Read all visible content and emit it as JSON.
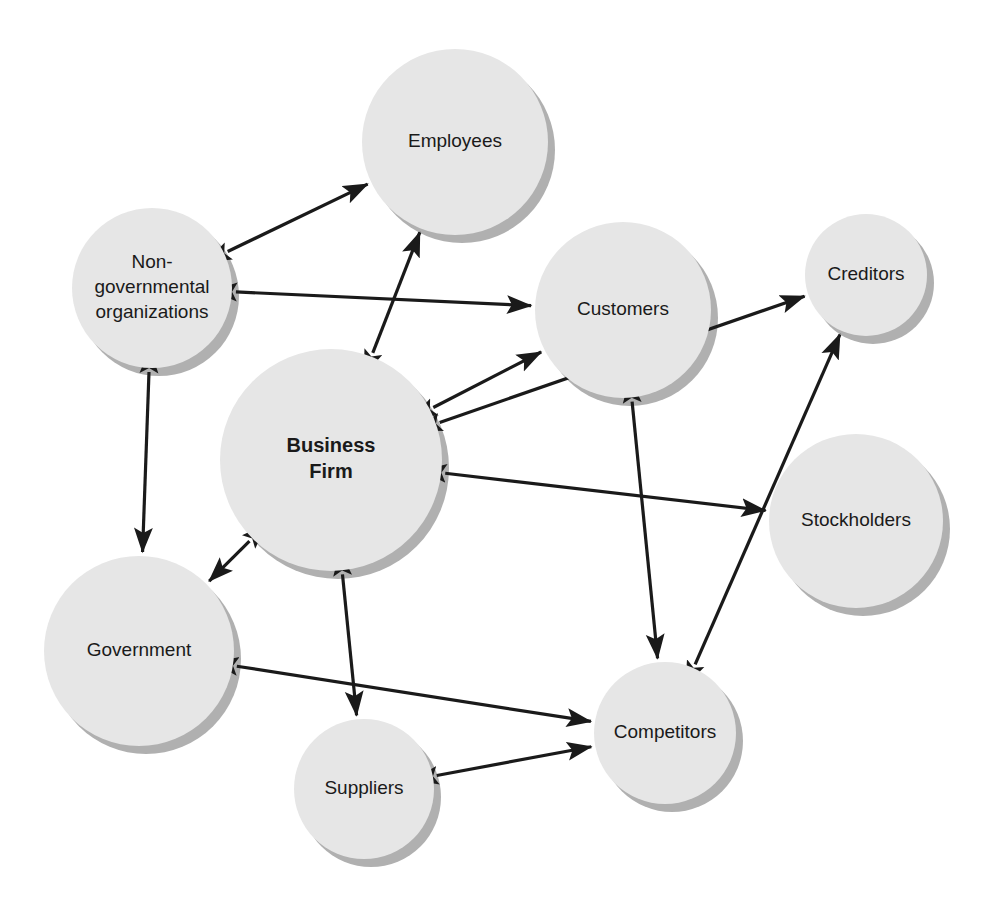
{
  "diagram": {
    "type": "node-link-diagram",
    "canvas": {
      "width": 994,
      "height": 909
    },
    "style": {
      "node_fill": "#e6e6e6",
      "node_shadow": "#b0b0b0",
      "connector_color": "#1a1a1a",
      "background": "#ffffff"
    },
    "nodes": [
      {
        "id": "employees",
        "label": "Employees",
        "lines": [
          "Employees"
        ],
        "cx": 455,
        "cy": 142,
        "r": 93,
        "bold": false
      },
      {
        "id": "ngo",
        "label": "Non-governmental organizations",
        "lines": [
          "Non-",
          "governmental",
          "organizations"
        ],
        "cx": 152,
        "cy": 288,
        "r": 80,
        "bold": false
      },
      {
        "id": "customers",
        "label": "Customers",
        "lines": [
          "Customers"
        ],
        "cx": 623,
        "cy": 310,
        "r": 88,
        "bold": false
      },
      {
        "id": "creditors",
        "label": "Creditors",
        "lines": [
          "Creditors"
        ],
        "cx": 866,
        "cy": 275,
        "r": 61,
        "bold": false
      },
      {
        "id": "business-firm",
        "label": "Business Firm",
        "lines": [
          "Business",
          "Firm"
        ],
        "cx": 331,
        "cy": 460,
        "r": 111,
        "bold": true
      },
      {
        "id": "stockholders",
        "label": "Stockholders",
        "lines": [
          "Stockholders"
        ],
        "cx": 856,
        "cy": 521,
        "r": 87,
        "bold": false
      },
      {
        "id": "government",
        "label": "Government",
        "lines": [
          "Government"
        ],
        "cx": 139,
        "cy": 651,
        "r": 95,
        "bold": false
      },
      {
        "id": "competitors",
        "label": "Competitors",
        "lines": [
          "Competitors"
        ],
        "cx": 665,
        "cy": 733,
        "r": 71,
        "bold": false
      },
      {
        "id": "suppliers",
        "label": "Suppliers",
        "lines": [
          "Suppliers"
        ],
        "cx": 364,
        "cy": 789,
        "r": 70,
        "bold": false
      }
    ],
    "edges": [
      {
        "id": "ngo-employees",
        "from": "ngo",
        "to": "employees",
        "bidirectional": true
      },
      {
        "id": "ngo-customers",
        "from": "ngo",
        "to": "customers",
        "bidirectional": true
      },
      {
        "id": "ngo-government",
        "from": "ngo",
        "to": "government",
        "bidirectional": true
      },
      {
        "id": "firm-employees",
        "from": "business-firm",
        "to": "employees",
        "bidirectional": true
      },
      {
        "id": "firm-customers",
        "from": "business-firm",
        "to": "customers",
        "bidirectional": true
      },
      {
        "id": "firm-stockholders",
        "from": "business-firm",
        "to": "stockholders",
        "bidirectional": true
      },
      {
        "id": "firm-creditors",
        "from": "business-firm",
        "to": "creditors",
        "bidirectional": true
      },
      {
        "id": "firm-government",
        "from": "business-firm",
        "to": "government",
        "bidirectional": true
      },
      {
        "id": "firm-suppliers",
        "from": "business-firm",
        "to": "suppliers",
        "bidirectional": true
      },
      {
        "id": "customers-competitors",
        "from": "customers",
        "to": "competitors",
        "bidirectional": true
      },
      {
        "id": "competitors-creditors",
        "from": "competitors",
        "to": "creditors",
        "bidirectional": true
      },
      {
        "id": "government-competitors",
        "from": "government",
        "to": "competitors",
        "bidirectional": true
      },
      {
        "id": "suppliers-competitors",
        "from": "suppliers",
        "to": "competitors",
        "bidirectional": true
      }
    ]
  }
}
